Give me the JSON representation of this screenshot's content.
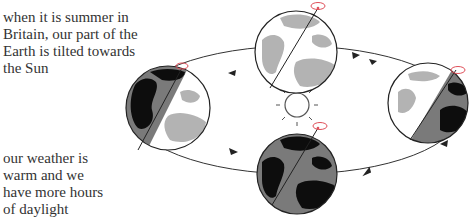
{
  "captions": {
    "top": [
      "when it is summer in",
      "Britain, our part of the",
      "Earth is tilted towards",
      "the Sun"
    ],
    "bottom": [
      "our weather is",
      "warm and we",
      "have more hours",
      "of daylight"
    ]
  },
  "diagram": {
    "orbit_direction": "anticlockwise",
    "colors": {
      "land_lit": "#b3b3b3",
      "land_dark": "#0d0d0d",
      "ocean_shadow": "#7a7a7a",
      "outline": "#222222",
      "spin_marker": "#e0505a"
    },
    "globes": [
      {
        "position": "left",
        "lit_side": "right"
      },
      {
        "position": "top",
        "lit_side": "full-lit"
      },
      {
        "position": "right",
        "lit_side": "left"
      },
      {
        "position": "bottom",
        "lit_side": "full-dark"
      }
    ]
  }
}
